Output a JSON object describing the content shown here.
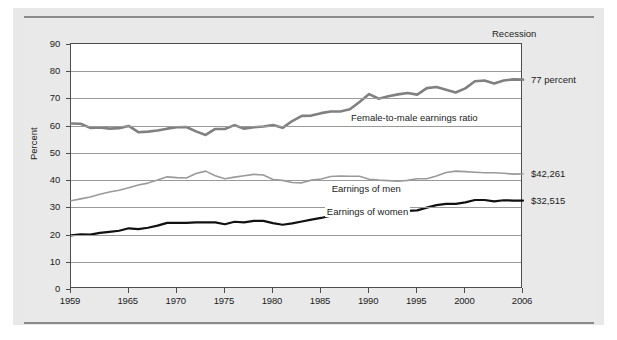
{
  "chart_data": {
    "type": "line",
    "title": "",
    "subtitle": "",
    "xlabel": "",
    "ylabel": "Percent",
    "xlim": [
      1959,
      2006
    ],
    "ylim": [
      0,
      90
    ],
    "grid": true,
    "legend_position": "inline-annotations",
    "x_tick_labels": [
      "1959",
      "1965",
      "1970",
      "1975",
      "1980",
      "1985",
      "1990",
      "1995",
      "2000",
      "2006"
    ],
    "x_tick_values": [
      1959,
      1965,
      1970,
      1975,
      1980,
      1985,
      1990,
      1995,
      2000,
      2006
    ],
    "y_tick_labels": [
      "0",
      "10",
      "20",
      "30",
      "40",
      "50",
      "60",
      "70",
      "80",
      "90"
    ],
    "y_tick_values": [
      0,
      10,
      20,
      30,
      40,
      50,
      60,
      70,
      80,
      90
    ],
    "annotations": [
      {
        "name": "recession-legend",
        "text": "Recession"
      },
      {
        "name": "ratio-series-label",
        "text": "Female-to-male earnings ratio"
      },
      {
        "name": "men-series-label",
        "text": "Earnings of men"
      },
      {
        "name": "women-series-label",
        "text": "Earnings of women"
      },
      {
        "name": "ratio-end-value",
        "text": "77 percent"
      },
      {
        "name": "men-end-value",
        "text": "$42,261"
      },
      {
        "name": "women-end-value",
        "text": "$32,515"
      }
    ],
    "x": [
      1959,
      1960,
      1961,
      1962,
      1963,
      1964,
      1965,
      1966,
      1967,
      1968,
      1969,
      1970,
      1971,
      1972,
      1973,
      1974,
      1975,
      1976,
      1977,
      1978,
      1979,
      1980,
      1981,
      1982,
      1983,
      1984,
      1985,
      1986,
      1987,
      1988,
      1989,
      1990,
      1991,
      1992,
      1993,
      1994,
      1995,
      1996,
      1997,
      1998,
      1999,
      2000,
      2001,
      2002,
      2003,
      2004,
      2005,
      2006
    ],
    "series": [
      {
        "name": "Female-to-male earnings ratio",
        "color": "#808080",
        "unit": "percent",
        "end_value": 77,
        "values": [
          60.8,
          60.7,
          59.2,
          59.3,
          58.9,
          59.1,
          59.9,
          57.6,
          57.8,
          58.2,
          58.9,
          59.4,
          59.5,
          57.9,
          56.6,
          58.8,
          58.8,
          60.2,
          58.9,
          59.4,
          59.7,
          60.2,
          59.2,
          61.7,
          63.6,
          63.7,
          64.6,
          65.2,
          65.2,
          66.0,
          68.7,
          71.6,
          69.9,
          70.8,
          71.5,
          72.0,
          71.4,
          73.8,
          74.2,
          73.2,
          72.2,
          73.7,
          76.3,
          76.6,
          75.5,
          76.6,
          77.0,
          76.9
        ]
      },
      {
        "name": "Earnings of men",
        "color": "#9a9a9a",
        "unit": "thousands of 2006 dollars",
        "end_value": 42261,
        "values": [
          32.4,
          33.1,
          33.8,
          34.8,
          35.6,
          36.3,
          37.2,
          38.2,
          38.9,
          40.0,
          41.2,
          40.9,
          40.8,
          42.4,
          43.3,
          41.6,
          40.5,
          41.1,
          41.6,
          42.1,
          41.9,
          40.2,
          39.9,
          39.1,
          39.0,
          40.0,
          40.4,
          41.3,
          41.5,
          41.4,
          41.4,
          40.3,
          40.0,
          39.8,
          39.6,
          39.9,
          40.5,
          40.5,
          41.5,
          42.8,
          43.3,
          43.1,
          42.9,
          42.7,
          42.7,
          42.5,
          42.2,
          42.3
        ]
      },
      {
        "name": "Earnings of women",
        "color": "#111111",
        "unit": "thousands of 2006 dollars",
        "end_value": 32515,
        "values": [
          19.7,
          20.1,
          20.0,
          20.6,
          21.0,
          21.4,
          22.3,
          22.0,
          22.5,
          23.3,
          24.3,
          24.3,
          24.3,
          24.5,
          24.5,
          24.5,
          23.8,
          24.7,
          24.5,
          25.0,
          25.0,
          24.2,
          23.6,
          24.1,
          24.8,
          25.5,
          26.1,
          26.9,
          27.1,
          27.3,
          28.4,
          28.9,
          28.0,
          28.2,
          28.3,
          28.7,
          28.9,
          29.9,
          30.8,
          31.3,
          31.3,
          31.8,
          32.7,
          32.7,
          32.2,
          32.6,
          32.5,
          32.5
        ]
      }
    ]
  }
}
